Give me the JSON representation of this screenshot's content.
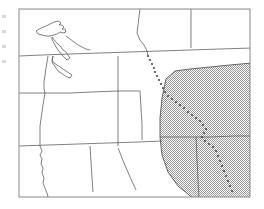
{
  "figure": {
    "kind": "reference-map",
    "title": "",
    "region_name": "Western United States and Pacific Northwest",
    "background_color": "#ffffff",
    "frame": {
      "x": 19,
      "y": 9,
      "width": 231,
      "height": 188,
      "stroke_color": "#888888",
      "stroke_width": 1,
      "fill_color": "#ffffff"
    },
    "edge_ticks": {
      "count": 4,
      "color": "#d8d8d8",
      "positions_y": [
        16,
        31,
        46,
        61
      ]
    },
    "layers": [
      {
        "name": "coastline",
        "type": "line",
        "stroke_color": "#555555",
        "stroke_width": 0.8,
        "label": "Pacific coastline and Puget Sound"
      },
      {
        "name": "state-boundaries",
        "type": "line",
        "stroke_color": "#555555",
        "stroke_width": 0.8,
        "label": "State and provincial boundaries"
      },
      {
        "name": "study-area",
        "type": "polygon",
        "fill_pattern": "stipple",
        "fill_color": "#a8a8a8",
        "stroke_color": "#555555",
        "stroke_width": 0.9,
        "label": "Shaded study area"
      },
      {
        "name": "dotted-divide",
        "type": "dotted-line",
        "dot_color": "#4a4a4a",
        "dot_radius": 1.1,
        "label": "Dotted boundary line (continental divide)"
      }
    ],
    "geometry": {
      "coastline_path": "M 62 25 L 56 31 L 52 36 L 55 40 L 59 43 L 64 46 L 68 49 L 72 52 L 76 55 L 73 58 L 69 60 L 66 63 L 63 66 L 60 70 L 58 75 L 57 81 L 56 86 L 55 91 L 54 96 L 53 101 L 52 106 L 51 112 L 50 118 L 49 124 L 48 130 L 47 136 L 49 141 L 48 147 L 50 152 L 49 158 L 51 163 L 50 169 L 52 175 L 51 181 L 53 187 L 54 193 L 55 197",
      "vancouver_island_path": "M 34 30 L 40 27 L 46 25 L 52 22 L 58 21 L 63 23 L 67 26 L 63 29 L 58 31 L 53 33 L 48 35 L 43 35 L 38 33 Z",
      "inner_sound_path": "M 56 36 L 60 40 L 63 44 L 66 48 L 69 52 L 71 56 L 68 59 L 65 56 L 62 52 L 59 48 L 56 44 L 54 40 Z",
      "study_area_polygon": "M 166 79 L 175 71 L 190 69 L 210 67 L 230 65 L 249 63 L 249 197 L 194 197 L 178 186 L 168 172 L 162 155 L 160 137 L 160 118 L 162 98 Z",
      "dotted_divide_points": [
        [
          148,
          56
        ],
        [
          150,
          60
        ],
        [
          152,
          64
        ],
        [
          154,
          68
        ],
        [
          155,
          72
        ],
        [
          157,
          76
        ],
        [
          159,
          80
        ],
        [
          161,
          84
        ],
        [
          163,
          88
        ],
        [
          165,
          92
        ],
        [
          168,
          96
        ],
        [
          172,
          99
        ],
        [
          176,
          102
        ],
        [
          180,
          105
        ],
        [
          184,
          108
        ],
        [
          188,
          112
        ],
        [
          192,
          115
        ],
        [
          196,
          118
        ],
        [
          200,
          121
        ],
        [
          203,
          125
        ],
        [
          206,
          129
        ],
        [
          204,
          133
        ],
        [
          202,
          137
        ],
        [
          205,
          141
        ],
        [
          209,
          144
        ],
        [
          213,
          147
        ],
        [
          216,
          151
        ],
        [
          218,
          156
        ],
        [
          220,
          161
        ],
        [
          222,
          166
        ],
        [
          224,
          171
        ],
        [
          226,
          176
        ],
        [
          228,
          181
        ],
        [
          230,
          186
        ],
        [
          232,
          191
        ]
      ],
      "state_boundary_paths": [
        "M 19 56 L 42 55 L 70 54 L 100 53 L 130 52 L 160 51 L 190 50 L 220 49 L 250 48",
        "M 140 9 L 139 17 L 138 25 L 137 33 L 140 40 L 144 45 L 147 51",
        "M 191 9 L 191 20 L 191 32 L 191 44 L 191 48",
        "M 19 93 L 48 93 L 70 93 L 92 92 L 118 91 L 140 91",
        "M 19 146 L 48 145 L 78 144 L 108 143 L 138 142 L 162 141",
        "M 118 56 L 118 74 L 118 92 L 118 110 L 118 128 L 118 146",
        "M 140 91 L 141 108 L 142 124 L 142 140",
        "M 90 146 L 91 162 L 92 178 L 93 192",
        "M 118 148 L 124 163 L 130 177 L 136 190",
        "M 160 137 L 184 137 L 210 137 L 234 136 L 249 136",
        "M 196 137 L 197 160 L 198 180 L 199 197",
        "M 19 197 L 60 197 L 110 197 L 160 197 L 200 197 L 250 197",
        "M 250 9 L 250 60 L 250 120 L 250 197"
      ]
    },
    "accent_colors": {
      "frame": "#888888",
      "boundary": "#555555",
      "shading": "#a8a8a8",
      "dotted": "#4a4a4a",
      "page": "#ffffff"
    }
  }
}
